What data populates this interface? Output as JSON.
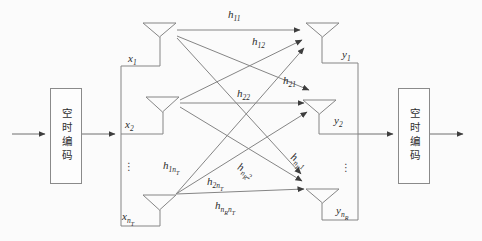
{
  "diagram_title": "MIMO space-time coding system diagram",
  "colors": {
    "background": "#fbfbfb",
    "line": "#858585",
    "arrowhead": "#3d3d3d",
    "text": "#2b2b2b",
    "box_border": "#8a8a8a",
    "box_background": "#fdfdfd"
  },
  "encoder_box": {
    "label": "空时编码"
  },
  "decoder_box": {
    "label": "空时编码"
  },
  "tx": {
    "signals": [
      {
        "base": "x",
        "s1": "1"
      },
      {
        "base": "x",
        "s1": "2"
      },
      {
        "base": "x",
        "s1": "n",
        "ss1": "T"
      }
    ],
    "ellipsis": "⋮"
  },
  "rx": {
    "signals": [
      {
        "base": "y",
        "s1": "1"
      },
      {
        "base": "y",
        "s1": "2"
      },
      {
        "base": "y",
        "s1": "n",
        "ss1": "R"
      }
    ],
    "ellipsis": "⋮"
  },
  "channels": {
    "h11": {
      "base": "h",
      "s1": "11"
    },
    "h12": {
      "base": "h",
      "s1": "12"
    },
    "h21": {
      "base": "h",
      "s1": "21"
    },
    "h22": {
      "base": "h",
      "s1": "22"
    },
    "h1nT": {
      "base": "h",
      "s1": "1n",
      "ss1": "T"
    },
    "h2nT": {
      "base": "h",
      "s1": "2n",
      "ss1": "T"
    },
    "hnR1": {
      "base": "h",
      "s1": "n",
      "ss1": "R",
      "s2": "1"
    },
    "hnR2": {
      "base": "h",
      "s1": "n",
      "ss1": "R",
      "s2": "2"
    },
    "hnRnT": {
      "base": "h",
      "s1": "n",
      "ss1": "R",
      "s2": "n",
      "ss2": "T"
    }
  }
}
